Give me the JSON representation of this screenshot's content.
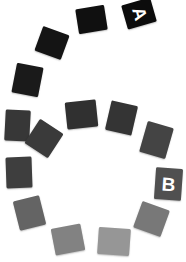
{
  "figure": {
    "background_color": "#ffffff",
    "width": 186,
    "height": 262,
    "label_color": "#ffffff"
  },
  "chart_data": {
    "type": "scatter",
    "xlabel": "",
    "ylabel": "",
    "xlim": [
      0,
      186
    ],
    "ylim": [
      0,
      262
    ],
    "grid": false,
    "legend": "none",
    "annotations": [
      "A",
      "B"
    ],
    "series": [
      {
        "name": "outer-arc",
        "values": [
          {
            "label": "A",
            "gray": 12,
            "color": "#0c0c0c",
            "x": 124,
            "y": 1,
            "w": 30,
            "h": 25,
            "rot": -16
          },
          {
            "label": "",
            "gray": 16,
            "color": "#101010",
            "x": 77,
            "y": 7,
            "w": 29,
            "h": 25,
            "rot": -9
          },
          {
            "label": "",
            "gray": 20,
            "color": "#141414",
            "x": 38,
            "y": 30,
            "w": 28,
            "h": 26,
            "rot": 20
          },
          {
            "label": "",
            "gray": 26,
            "color": "#1a1a1a",
            "x": 14,
            "y": 65,
            "w": 27,
            "h": 30,
            "rot": 11
          },
          {
            "label": "",
            "gray": 55,
            "color": "#373737",
            "x": 5,
            "y": 110,
            "w": 25,
            "h": 31,
            "rot": 3
          },
          {
            "label": "",
            "gray": 62,
            "color": "#3e3e3e",
            "x": 6,
            "y": 157,
            "w": 26,
            "h": 31,
            "rot": -2
          },
          {
            "label": "",
            "gray": 100,
            "color": "#646464",
            "x": 16,
            "y": 198,
            "w": 27,
            "h": 30,
            "rot": -14
          },
          {
            "label": "",
            "gray": 130,
            "color": "#828282",
            "x": 53,
            "y": 226,
            "w": 30,
            "h": 27,
            "rot": -11
          },
          {
            "label": "",
            "gray": 150,
            "color": "#969696",
            "x": 98,
            "y": 228,
            "w": 32,
            "h": 27,
            "rot": 4
          },
          {
            "label": "",
            "gray": 120,
            "color": "#787878",
            "x": 137,
            "y": 205,
            "w": 29,
            "h": 28,
            "rot": 20
          },
          {
            "label": "B",
            "gray": 80,
            "color": "#505050",
            "x": 155,
            "y": 168,
            "w": 27,
            "h": 32,
            "rot": 4
          },
          {
            "label": "",
            "gray": 68,
            "color": "#444444",
            "x": 143,
            "y": 124,
            "w": 27,
            "h": 32,
            "rot": 16
          }
        ]
      },
      {
        "name": "inner-arc",
        "values": [
          {
            "label": "",
            "gray": 48,
            "color": "#303030",
            "x": 66,
            "y": 101,
            "w": 31,
            "h": 27,
            "rot": -6
          },
          {
            "label": "",
            "gray": 52,
            "color": "#343434",
            "x": 108,
            "y": 103,
            "w": 27,
            "h": 30,
            "rot": 13
          },
          {
            "label": "",
            "gray": 58,
            "color": "#3a3a3a",
            "x": 30,
            "y": 124,
            "w": 28,
            "h": 29,
            "rot": 33
          }
        ]
      }
    ]
  }
}
